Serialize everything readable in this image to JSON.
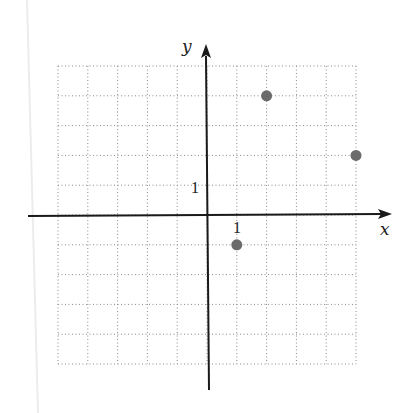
{
  "chart_data": {
    "type": "scatter",
    "title": "",
    "xlabel": "x",
    "ylabel": "y",
    "xlim": [
      -5,
      5
    ],
    "ylim": [
      -5,
      5
    ],
    "grid": true,
    "grid_style": "dotted",
    "tick_labels": {
      "x": [
        "1"
      ],
      "y": [
        "1"
      ]
    },
    "points": [
      {
        "x": 2,
        "y": 4
      },
      {
        "x": 5,
        "y": 2
      },
      {
        "x": 1,
        "y": -1
      }
    ],
    "point_color": "#6b6b6b",
    "axis_color": "#1a1a1a",
    "grid_color": "#8a8a8a"
  }
}
